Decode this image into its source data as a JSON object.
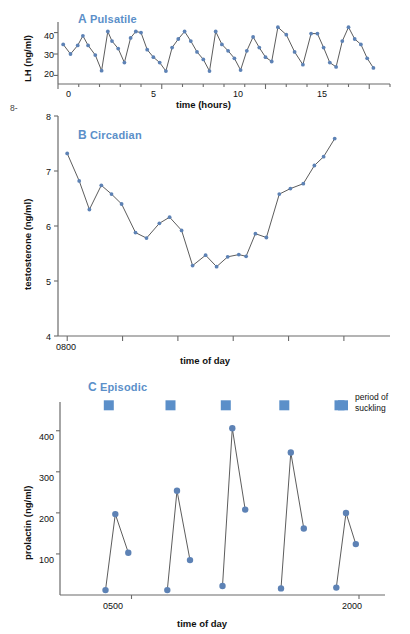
{
  "figure": {
    "panels": [
      {
        "id": "A",
        "letter": "A",
        "title": "Pulsatile",
        "ylabel": "LH (ng/ml)",
        "xlabel": "time (hours)",
        "ytick_labels": [
          "20",
          "30",
          "40"
        ],
        "xtick_labels": [
          "0",
          "5",
          "10",
          "15"
        ]
      },
      {
        "id": "B",
        "letter": "B",
        "title": "Circadian",
        "ylabel": "testosterone (ng/ml)",
        "xlabel": "time of day",
        "ytick_labels": [
          "4",
          "5",
          "6",
          "7",
          "8"
        ],
        "xtick_labels": [
          "0800"
        ]
      },
      {
        "id": "C",
        "letter": "C",
        "title": "Episodic",
        "ylabel": "prolactin (ng/ml)",
        "xlabel": "time of day",
        "ytick_labels": [
          "100",
          "200",
          "300",
          "400"
        ],
        "xtick_labels": [
          "0500",
          "2000"
        ],
        "legend_line1": "period of",
        "legend_line2": "suckling"
      }
    ],
    "colors": {
      "marker": "#5d82b5",
      "marker_square": "#5b8fc9",
      "title": "#5b8fc9",
      "line": "#4a4a4a",
      "axis": "#6b6b6b"
    },
    "stray_text": "8-"
  },
  "chart_data": [
    {
      "type": "line",
      "panel": "A",
      "title": "A Pulsatile",
      "xlabel": "time (hours)",
      "ylabel": "LH (ng/ml)",
      "xlim": [
        0,
        16
      ],
      "ylim": [
        16,
        44
      ],
      "xticks": [
        0,
        5,
        10,
        15
      ],
      "yticks": [
        20,
        30,
        40
      ],
      "grid": false,
      "legend": false,
      "x": [
        0.25,
        0.6,
        0.95,
        1.2,
        1.45,
        1.8,
        2.1,
        2.4,
        2.6,
        2.9,
        3.2,
        3.5,
        3.75,
        4.0,
        4.3,
        4.6,
        4.9,
        5.2,
        5.5,
        5.8,
        6.1,
        6.4,
        6.7,
        7.0,
        7.3,
        7.6,
        7.9,
        8.2,
        8.5,
        8.8,
        9.1,
        9.4,
        9.7,
        10.0,
        10.3,
        10.6,
        11.0,
        11.4,
        11.8,
        12.2,
        12.5,
        12.8,
        13.1,
        13.4,
        13.7,
        14.0,
        14.3,
        14.6,
        14.9,
        15.2
      ],
      "y": [
        34.5,
        30.0,
        34.0,
        38.5,
        34.0,
        29.5,
        22.2,
        40.5,
        36.0,
        32.5,
        26.0,
        37.5,
        40.5,
        40.0,
        32.0,
        28.5,
        26.0,
        22.0,
        33.0,
        37.0,
        40.5,
        36.0,
        31.0,
        27.5,
        22.0,
        40.5,
        34.5,
        31.5,
        28.0,
        22.5,
        31.5,
        38.0,
        33.0,
        28.5,
        26.5,
        42.5,
        39.0,
        31.0,
        25.0,
        39.5,
        39.5,
        33.0,
        26.0,
        24.0,
        36.0,
        42.5,
        37.0,
        34.5,
        28.0,
        23.5
      ]
    },
    {
      "type": "line",
      "panel": "B",
      "title": "B Circadian",
      "xlabel": "time of day",
      "ylabel": "testosterone (ng/ml)",
      "xlim": [
        0,
        36
      ],
      "ylim": [
        4,
        8
      ],
      "xticks": [
        1
      ],
      "xtick_labels": [
        "0800"
      ],
      "yticks": [
        4,
        5,
        6,
        7,
        8
      ],
      "grid": false,
      "legend": false,
      "x": [
        1.0,
        2.3,
        3.4,
        4.7,
        5.8,
        6.9,
        8.4,
        9.6,
        11.0,
        12.1,
        13.4,
        14.6,
        16.0,
        17.2,
        18.4,
        19.6,
        20.4,
        21.4,
        22.6,
        24.0,
        25.2,
        26.6,
        27.8,
        28.8,
        30.0,
        31.2,
        32.4,
        33.6,
        34.8
      ],
      "y": [
        7.32,
        6.82,
        6.3,
        6.74,
        6.58,
        6.4,
        5.88,
        5.78,
        6.05,
        6.16,
        5.92,
        5.28,
        5.47,
        5.26,
        5.44,
        5.48,
        5.45,
        5.86,
        5.79,
        6.58,
        6.68,
        6.77,
        7.1,
        7.26,
        7.59,
        7.59,
        7.59,
        7.59,
        7.59
      ]
    },
    {
      "type": "line",
      "panel": "C",
      "title": "C Episodic",
      "xlabel": "time of day",
      "ylabel": "prolactin (ng/ml)",
      "xlim": [
        0,
        100
      ],
      "ylim": [
        0,
        470
      ],
      "yticks": [
        100,
        200,
        300,
        400
      ],
      "xticks": [
        22,
        92
      ],
      "xtick_labels": [
        "0500",
        "2000"
      ],
      "grid": false,
      "legend": true,
      "legend_label": "period of suckling",
      "segments": [
        {
          "x": [
            14,
            17,
            21
          ],
          "y": [
            12,
            197,
            103
          ]
        },
        {
          "x": [
            33,
            36,
            40
          ],
          "y": [
            12,
            254,
            85
          ]
        },
        {
          "x": [
            50,
            53,
            57
          ],
          "y": [
            22,
            406,
            208
          ]
        },
        {
          "x": [
            68,
            71,
            75
          ],
          "y": [
            16,
            347,
            162
          ]
        },
        {
          "x": [
            85,
            88,
            91
          ],
          "y": [
            18,
            200,
            124
          ]
        }
      ],
      "suckling_periods_x": [
        15,
        34,
        51,
        69,
        86
      ]
    }
  ]
}
